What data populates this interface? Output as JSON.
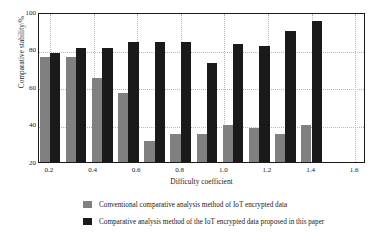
{
  "chart_data": {
    "type": "bar",
    "title": "",
    "xlabel": "Difficulty coefficient",
    "ylabel": "Comparative stability/%",
    "xlim": [
      0.15,
      1.65
    ],
    "ylim": [
      20,
      100
    ],
    "yticks": [
      20,
      40,
      60,
      80,
      100
    ],
    "xticks": [
      0.2,
      0.4,
      0.6,
      0.8,
      1.0,
      1.2,
      1.4,
      1.6
    ],
    "xticklabels": [
      "0.2",
      "0.4",
      "0.6",
      "0.8",
      "1.0",
      "1.2",
      "1.4",
      "1.6"
    ],
    "yticklabels": [
      "20",
      "40",
      "60",
      "80",
      "100"
    ],
    "grid": true,
    "legend_position": "below",
    "x": [
      0.2,
      0.32,
      0.44,
      0.56,
      0.68,
      0.8,
      0.92,
      1.04,
      1.16,
      1.28,
      1.4,
      1.52
    ],
    "categories": [
      "0.2",
      "0.3",
      "0.4",
      "0.5",
      "0.6",
      "0.8",
      "0.9",
      "1.0",
      "1.1",
      "1.3",
      "1.4",
      "1.5"
    ],
    "series": [
      {
        "name": "Conventional comparative analysis method of IoT encrypted data",
        "color": "#808080",
        "values": [
          76,
          76,
          65,
          57,
          31,
          35,
          35,
          40,
          38,
          35,
          40,
          0
        ]
      },
      {
        "name": "Comparative analysis method of the IoT encrypted data proposed in this paper",
        "color": "#1a1a1a",
        "values": [
          78,
          81,
          81,
          84,
          84,
          84,
          73,
          83,
          82,
          90,
          95,
          0
        ]
      }
    ]
  },
  "legend": {
    "items": [
      {
        "label": "Conventional comparative analysis method of IoT encrypted data",
        "color": "#808080"
      },
      {
        "label": "Comparative analysis method of the IoT encrypted data proposed in this paper",
        "color": "#1a1a1a"
      }
    ]
  }
}
